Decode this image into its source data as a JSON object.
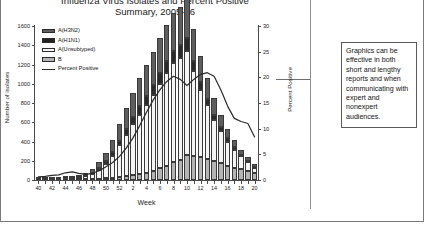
{
  "document": {
    "callout_text": "Graphics can be effective in both short and lengthy reports and when communicating with expert and nonexpert audiences."
  },
  "chart_data": {
    "type": "bar",
    "title": "Influenza Virus Isolates and Percent Positive",
    "title_line1": "Influenza Virus Isolates and Percent Positive",
    "title_line2": "Summary, 2005-06",
    "xlabel": "Week",
    "ylabel": "Number of isolates",
    "ylabel_right": "Percent Positive",
    "ylim": [
      0,
      1600
    ],
    "ylim_right": [
      0,
      30
    ],
    "yticks": [
      0,
      200,
      400,
      600,
      800,
      1000,
      1200,
      1400,
      1600
    ],
    "yticks_right": [
      0,
      5,
      10,
      15,
      20,
      25,
      30
    ],
    "grid": false,
    "legend_position": "upper-left-inside",
    "stacked": true,
    "categories": [
      "40",
      "41",
      "42",
      "43",
      "44",
      "45",
      "46",
      "47",
      "48",
      "49",
      "50",
      "51",
      "52",
      "1",
      "2",
      "3",
      "4",
      "5",
      "6",
      "7",
      "8",
      "9",
      "10",
      "11",
      "12",
      "13",
      "14",
      "15",
      "16",
      "17",
      "18",
      "19",
      "20"
    ],
    "xtick_labels": [
      "40",
      "42",
      "44",
      "46",
      "48",
      "50",
      "52",
      "2",
      "4",
      "6",
      "8",
      "10",
      "12",
      "14",
      "16",
      "18",
      "20"
    ],
    "series": [
      {
        "name": "B",
        "color": "#b4b4b4",
        "values": [
          2,
          2,
          3,
          3,
          4,
          5,
          6,
          8,
          10,
          14,
          18,
          22,
          30,
          40,
          50,
          60,
          75,
          95,
          120,
          150,
          185,
          210,
          255,
          250,
          235,
          215,
          195,
          175,
          150,
          130,
          110,
          90,
          70
        ]
      },
      {
        "name": "A(Unsubtyped)",
        "color": "#f4f4f4",
        "values": [
          4,
          5,
          6,
          8,
          10,
          14,
          20,
          30,
          55,
          95,
          150,
          230,
          330,
          430,
          530,
          620,
          700,
          790,
          880,
          960,
          1030,
          1060,
          1085,
          880,
          700,
          560,
          430,
          330,
          250,
          185,
          135,
          95,
          60
        ]
      },
      {
        "name": "A(H1N1)",
        "color": "#2a2a2a",
        "values": [
          1,
          1,
          2,
          2,
          3,
          4,
          5,
          8,
          12,
          18,
          25,
          35,
          48,
          60,
          72,
          85,
          95,
          105,
          115,
          125,
          130,
          135,
          140,
          110,
          88,
          70,
          55,
          42,
          32,
          24,
          17,
          12,
          8
        ]
      },
      {
        "name": "A(H3N2)",
        "color": "#5e5e5e",
        "values": [
          3,
          4,
          5,
          6,
          8,
          11,
          16,
          24,
          40,
          60,
          90,
          125,
          170,
          215,
          255,
          290,
          320,
          345,
          365,
          380,
          390,
          395,
          400,
          330,
          270,
          215,
          170,
          130,
          100,
          75,
          55,
          38,
          25
        ]
      }
    ],
    "line_series": {
      "name": "Percent Positive",
      "color": "#2b2b2b",
      "axis": "right",
      "values": [
        0.6,
        0.7,
        0.9,
        1.0,
        1.4,
        1.6,
        1.3,
        1.1,
        1.3,
        1.8,
        2.6,
        3.4,
        4.6,
        6.2,
        8.2,
        10.6,
        13.2,
        15.6,
        17.6,
        19.2,
        20.2,
        19.6,
        18.4,
        19.6,
        20.6,
        20.9,
        20.2,
        17.6,
        14.4,
        12.0,
        11.4,
        11.0,
        8.4
      ]
    }
  }
}
